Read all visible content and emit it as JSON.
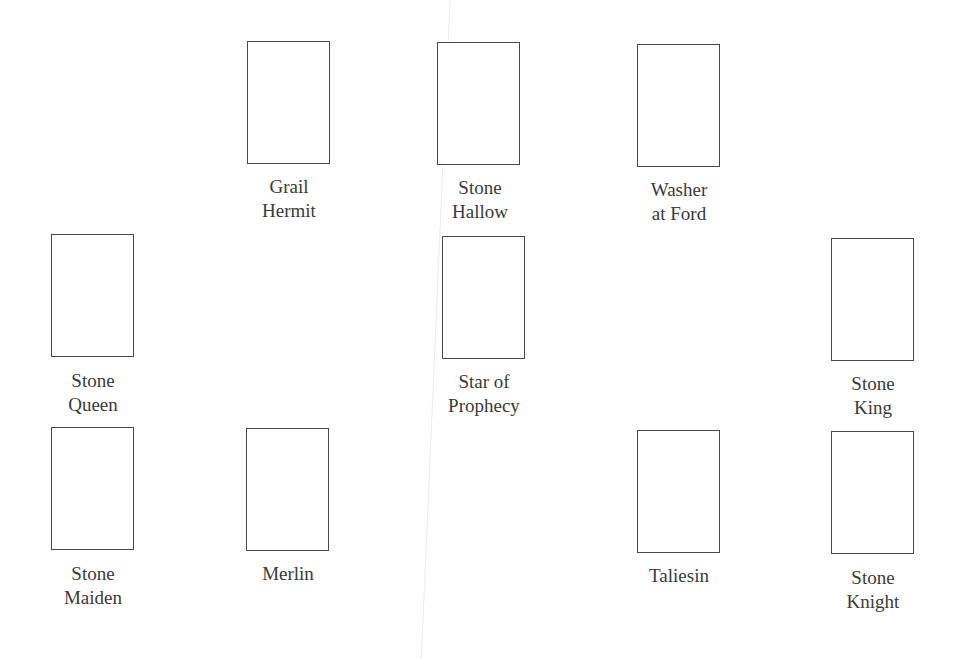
{
  "spread": {
    "positions": [
      {
        "id": "grail-hermit",
        "lines": [
          "Grail",
          "Hermit"
        ],
        "box": [
          247,
          41
        ]
      },
      {
        "id": "stone-hallow",
        "lines": [
          "Stone",
          "Hallow"
        ],
        "box": [
          437,
          42
        ]
      },
      {
        "id": "washer-at-ford",
        "lines": [
          "Washer",
          "at Ford"
        ],
        "box": [
          637,
          44
        ]
      },
      {
        "id": "stone-queen",
        "lines": [
          "Stone",
          "Queen"
        ],
        "box": [
          51,
          234
        ]
      },
      {
        "id": "star-of-prophecy",
        "lines": [
          "Star of",
          "Prophecy"
        ],
        "box": [
          442,
          236
        ]
      },
      {
        "id": "stone-king",
        "lines": [
          "Stone",
          "King"
        ],
        "box": [
          831,
          238
        ]
      },
      {
        "id": "stone-maiden",
        "lines": [
          "Stone",
          "Maiden"
        ],
        "box": [
          51,
          427
        ]
      },
      {
        "id": "merlin",
        "lines": [
          "Merlin"
        ],
        "box": [
          246,
          428
        ]
      },
      {
        "id": "taliesin",
        "lines": [
          "Taliesin"
        ],
        "box": [
          637,
          430
        ]
      },
      {
        "id": "stone-knight",
        "lines": [
          "Stone",
          "Knight"
        ],
        "box": [
          831,
          431
        ]
      }
    ]
  }
}
